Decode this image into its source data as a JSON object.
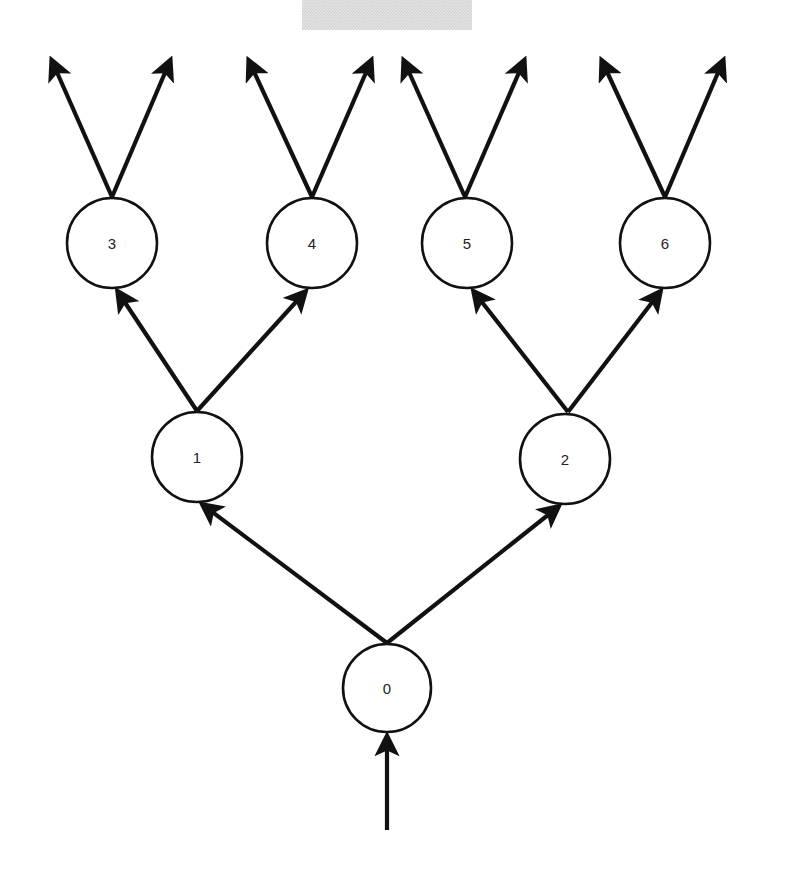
{
  "diagram": {
    "type": "binary-tree",
    "colors": {
      "stroke": "#111111",
      "background": "#ffffff",
      "top_strip": "#d8d8d8"
    },
    "nodes": [
      {
        "id": "0",
        "label": "0",
        "cx": 387,
        "cy": 688,
        "r": 44
      },
      {
        "id": "1",
        "label": "1",
        "cx": 197,
        "cy": 457,
        "r": 45
      },
      {
        "id": "2",
        "label": "2",
        "cx": 565,
        "cy": 459,
        "r": 45
      },
      {
        "id": "3",
        "label": "3",
        "cx": 112,
        "cy": 243,
        "r": 45
      },
      {
        "id": "4",
        "label": "4",
        "cx": 312,
        "cy": 243,
        "r": 45
      },
      {
        "id": "5",
        "label": "5",
        "cx": 467,
        "cy": 243,
        "r": 45
      },
      {
        "id": "6",
        "label": "6",
        "cx": 665,
        "cy": 243,
        "r": 45
      }
    ],
    "edges": [
      {
        "from": "input",
        "to": "0",
        "x1": 387,
        "y1": 830,
        "x2": 387,
        "y2": 737
      },
      {
        "from": "0",
        "to": "1",
        "x1": 387,
        "y1": 643,
        "x2": 203,
        "y2": 505
      },
      {
        "from": "0",
        "to": "2",
        "x1": 387,
        "y1": 643,
        "x2": 558,
        "y2": 507
      },
      {
        "from": "1",
        "to": "3",
        "x1": 197,
        "y1": 411,
        "x2": 118,
        "y2": 292
      },
      {
        "from": "1",
        "to": "4",
        "x1": 197,
        "y1": 411,
        "x2": 305,
        "y2": 292
      },
      {
        "from": "2",
        "to": "5",
        "x1": 568,
        "y1": 412,
        "x2": 474,
        "y2": 292
      },
      {
        "from": "2",
        "to": "6",
        "x1": 568,
        "y1": 412,
        "x2": 660,
        "y2": 292
      },
      {
        "from": "3",
        "to": "out",
        "x1": 112,
        "y1": 197,
        "x2": 52,
        "y2": 61
      },
      {
        "from": "3",
        "to": "out",
        "x1": 112,
        "y1": 197,
        "x2": 170,
        "y2": 61
      },
      {
        "from": "4",
        "to": "out",
        "x1": 312,
        "y1": 197,
        "x2": 249,
        "y2": 61
      },
      {
        "from": "4",
        "to": "out",
        "x1": 312,
        "y1": 197,
        "x2": 371,
        "y2": 61
      },
      {
        "from": "5",
        "to": "out",
        "x1": 465,
        "y1": 197,
        "x2": 404,
        "y2": 61
      },
      {
        "from": "5",
        "to": "out",
        "x1": 465,
        "y1": 197,
        "x2": 524,
        "y2": 61
      },
      {
        "from": "6",
        "to": "out",
        "x1": 665,
        "y1": 197,
        "x2": 602,
        "y2": 61
      },
      {
        "from": "6",
        "to": "out",
        "x1": 665,
        "y1": 197,
        "x2": 723,
        "y2": 61
      }
    ]
  }
}
